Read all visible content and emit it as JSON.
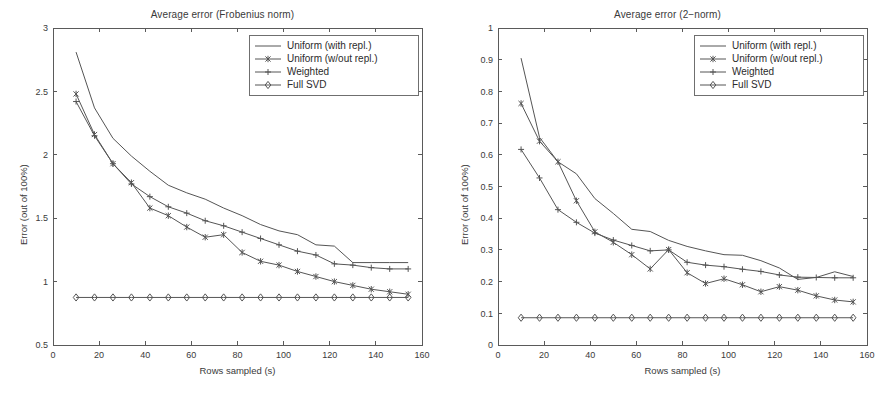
{
  "figure": {
    "background": "#ffffff",
    "line_color": "#555555",
    "axis_color": "#5a5a5a"
  },
  "panels": [
    {
      "name": "frobenius",
      "chart_data": {
        "type": "line",
        "title": "Average error (Frobenius norm)",
        "xlabel": "Rows sampled (s)",
        "ylabel": "Error (out of 100%)",
        "xlim": [
          0,
          160
        ],
        "ylim": [
          0.5,
          3
        ],
        "xticks": [
          0,
          20,
          40,
          60,
          80,
          100,
          120,
          140,
          160
        ],
        "xtick_labels": [
          "0",
          "20",
          "40",
          "60",
          "80",
          "100",
          "120",
          "140",
          "160"
        ],
        "yticks": [
          0.5,
          1,
          1.5,
          2,
          2.5,
          3
        ],
        "ytick_labels": [
          "0.5",
          "1",
          "1.5",
          "2",
          "2.5",
          "3"
        ],
        "grid": false,
        "legend_position": "upper right",
        "x": [
          10,
          18,
          26,
          34,
          42,
          50,
          58,
          66,
          74,
          82,
          90,
          98,
          106,
          114,
          122,
          130,
          138,
          146,
          154
        ],
        "series": [
          {
            "name": "Uniform (with repl.)",
            "marker": "none",
            "values": [
              2.81,
              2.37,
              2.13,
              1.99,
              1.87,
              1.76,
              1.7,
              1.65,
              1.58,
              1.52,
              1.45,
              1.4,
              1.37,
              1.29,
              1.28,
              1.15,
              1.15,
              1.15,
              1.15
            ]
          },
          {
            "name": "Uniform (w/out repl.)",
            "marker": "asterisk",
            "values": [
              2.48,
              2.16,
              1.93,
              1.78,
              1.58,
              1.52,
              1.43,
              1.35,
              1.37,
              1.23,
              1.16,
              1.13,
              1.08,
              1.04,
              1.0,
              0.97,
              0.94,
              0.92,
              0.9
            ]
          },
          {
            "name": "Weighted",
            "marker": "plus",
            "values": [
              2.42,
              2.15,
              1.93,
              1.77,
              1.67,
              1.59,
              1.54,
              1.48,
              1.44,
              1.39,
              1.34,
              1.29,
              1.24,
              1.21,
              1.14,
              1.13,
              1.11,
              1.1,
              1.1
            ]
          },
          {
            "name": "Full SVD",
            "marker": "diamond",
            "values": [
              0.875,
              0.875,
              0.875,
              0.875,
              0.875,
              0.875,
              0.875,
              0.875,
              0.875,
              0.875,
              0.875,
              0.875,
              0.875,
              0.875,
              0.875,
              0.875,
              0.875,
              0.875,
              0.875
            ]
          }
        ]
      }
    },
    {
      "name": "two-norm",
      "chart_data": {
        "type": "line",
        "title": "Average error (2−norm)",
        "xlabel": "Rows sampled (s)",
        "ylabel": "Error (out of 100%)",
        "xlim": [
          0,
          160
        ],
        "ylim": [
          0,
          1
        ],
        "xticks": [
          0,
          20,
          40,
          60,
          80,
          100,
          120,
          140,
          160
        ],
        "xtick_labels": [
          "0",
          "20",
          "40",
          "60",
          "80",
          "100",
          "120",
          "140",
          "160"
        ],
        "yticks": [
          0,
          0.1,
          0.2,
          0.3,
          0.4,
          0.5,
          0.6,
          0.7,
          0.8,
          0.9,
          1
        ],
        "ytick_labels": [
          "0",
          "0.1",
          "0.2",
          "0.3",
          "0.4",
          "0.5",
          "0.6",
          "0.7",
          "0.8",
          "0.9",
          "1"
        ],
        "grid": false,
        "legend_position": "upper right",
        "x": [
          10,
          18,
          26,
          34,
          42,
          50,
          58,
          66,
          74,
          82,
          90,
          98,
          106,
          114,
          122,
          130,
          138,
          146,
          154
        ],
        "series": [
          {
            "name": "Uniform (with repl.)",
            "marker": "none",
            "values": [
              0.905,
              0.655,
              0.578,
              0.54,
              0.462,
              0.415,
              0.365,
              0.358,
              0.33,
              0.311,
              0.297,
              0.285,
              0.283,
              0.266,
              0.243,
              0.207,
              0.213,
              0.231,
              0.216
            ]
          },
          {
            "name": "Uniform (w/out repl.)",
            "marker": "asterisk",
            "values": [
              0.762,
              0.643,
              0.578,
              0.455,
              0.357,
              0.324,
              0.285,
              0.24,
              0.301,
              0.228,
              0.194,
              0.209,
              0.19,
              0.168,
              0.184,
              0.173,
              0.155,
              0.142,
              0.136
            ]
          },
          {
            "name": "Weighted",
            "marker": "plus",
            "values": [
              0.617,
              0.527,
              0.427,
              0.387,
              0.353,
              0.331,
              0.314,
              0.297,
              0.3,
              0.261,
              0.252,
              0.247,
              0.239,
              0.232,
              0.221,
              0.214,
              0.213,
              0.212,
              0.212
            ]
          },
          {
            "name": "Full SVD",
            "marker": "diamond",
            "values": [
              0.086,
              0.086,
              0.086,
              0.086,
              0.086,
              0.086,
              0.086,
              0.086,
              0.086,
              0.086,
              0.086,
              0.086,
              0.086,
              0.086,
              0.086,
              0.086,
              0.086,
              0.086,
              0.086
            ]
          }
        ]
      }
    }
  ]
}
